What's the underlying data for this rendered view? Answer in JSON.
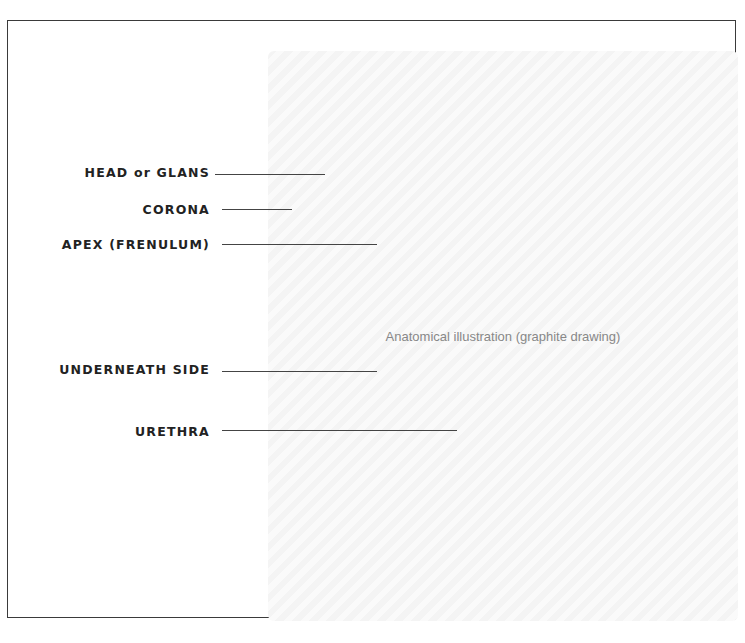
{
  "diagram": {
    "type": "anatomical-illustration",
    "style": "pencil/graphite line drawing",
    "illustration_placeholder": "Anatomical illustration (graphite drawing)",
    "labels": [
      {
        "text": "HEAD or GLANS"
      },
      {
        "text": "CORONA"
      },
      {
        "text": "APEX (FRENULUM)"
      },
      {
        "text": "UNDERNEATH SIDE"
      },
      {
        "text": "URETHRA"
      }
    ]
  }
}
